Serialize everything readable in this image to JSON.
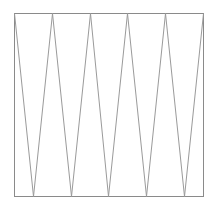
{
  "diagram": {
    "type": "zigzag-in-rectangle",
    "frame": {
      "x1": 14,
      "y1": 13,
      "x2": 203,
      "y2": 196
    },
    "top_vertices_x": [
      14,
      52,
      90,
      127,
      165,
      203
    ],
    "bottom_vertices_x": [
      33,
      71,
      108,
      146,
      184
    ],
    "colors": {
      "frame": "#8a8a8a",
      "zigzag": "#9a9a9a",
      "background": "#ffffff"
    }
  }
}
